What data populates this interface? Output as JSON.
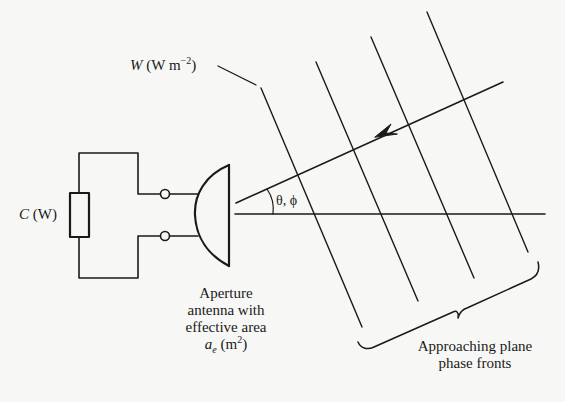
{
  "diagram": {
    "type": "antenna-receiving-aperture",
    "colors": {
      "background": "#f7f7f5",
      "ink": "#1a1a1a"
    },
    "labels": {
      "power_density": {
        "symbol": "W",
        "unit_open": "(W m",
        "unit_exp": "−2",
        "unit_close": ")"
      },
      "received_power": {
        "symbol": "C",
        "unit": "(W)"
      },
      "angle": "θ, ϕ",
      "antenna": {
        "line1": "Aperture",
        "line2": "antenna with",
        "line3": "effective area",
        "area_symbol": "a",
        "area_sub": "e",
        "area_unit_open": "(m",
        "area_unit_exp": "2",
        "area_unit_close": ")"
      },
      "phase_fronts": {
        "line1": "Approaching plane",
        "line2": "phase fronts"
      }
    },
    "elements": {
      "phase_front_count": 4,
      "terminals": 2,
      "load": "resistor"
    }
  }
}
